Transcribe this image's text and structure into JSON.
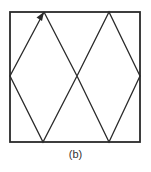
{
  "figure": {
    "caption": "(b)",
    "stroke_color": "#2a2a2a",
    "box": {
      "x": 10,
      "y": 12,
      "width": 130,
      "height": 130
    },
    "path_points": [
      [
        44,
        12
      ],
      [
        10,
        76
      ],
      [
        43,
        142
      ],
      [
        77,
        76
      ],
      [
        109,
        12
      ],
      [
        140,
        76
      ],
      [
        109,
        142
      ],
      [
        77,
        76
      ],
      [
        44,
        12
      ]
    ],
    "arrow_at": [
      44,
      12
    ],
    "arrow_direction": "up-right"
  }
}
